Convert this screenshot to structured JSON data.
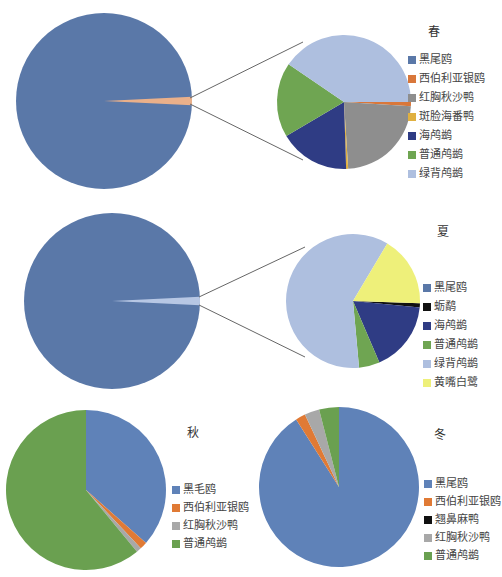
{
  "chart_data": [
    {
      "type": "pie-of-pie",
      "title": "春",
      "primary": {
        "categories": [
          "黑尾鸥",
          "其他"
        ],
        "values": [
          98.5,
          1.5
        ]
      },
      "secondary": {
        "categories": [
          "黑尾鸥",
          "西伯利亚银鸥",
          "红胸秋沙鸭",
          "斑脸海番鸭",
          "海鸬鹚",
          "普通鸬鹚",
          "绿背鸬鹚"
        ],
        "values": [
          0,
          1,
          23,
          0.5,
          17,
          18,
          40.5
        ]
      },
      "legend": [
        "黑尾鸥",
        "西伯利亚银鸥",
        "红胸秋沙鸭",
        "斑脸海番鸭",
        "海鸬鹚",
        "普通鸬鹚",
        "绿背鸬鹚"
      ],
      "colors": [
        "#5a78a8",
        "#d9773a",
        "#8e8e8e",
        "#e0b040",
        "#2f3c84",
        "#6fa552",
        "#aebfdf"
      ]
    },
    {
      "type": "pie-of-pie",
      "title": "夏",
      "primary": {
        "categories": [
          "黑尾鸥",
          "其他"
        ],
        "values": [
          98.5,
          1.5
        ]
      },
      "secondary": {
        "categories": [
          "黑尾鸥",
          "蛎鹬",
          "海鸬鹚",
          "普通鸬鹚",
          "绿背鸬鹚",
          "黄嘴白鹭"
        ],
        "values": [
          0,
          1,
          17,
          5,
          60,
          17
        ]
      },
      "legend": [
        "黑尾鸥",
        "蛎鹬",
        "海鸬鹚",
        "普通鸬鹚",
        "绿背鸬鹚",
        "黄嘴白鹭"
      ],
      "colors": [
        "#5a78a8",
        "#111111",
        "#2f3c84",
        "#6fa552",
        "#aebfdf",
        "#eef07a"
      ]
    },
    {
      "type": "pie",
      "title": "秋",
      "categories": [
        "黑毛鸥",
        "西伯利亚银鸥",
        "红胸秋沙鸭",
        "普通鸬鹚"
      ],
      "values": [
        36.5,
        1.5,
        1,
        61
      ],
      "colors": [
        "#5f82b8",
        "#e07a35",
        "#a8a8a8",
        "#6aa050"
      ]
    },
    {
      "type": "pie",
      "title": "冬",
      "categories": [
        "黑尾鸥",
        "西伯利亚银鸥",
        "翘鼻麻鸭",
        "红胸秋沙鸭",
        "普通鸬鹚"
      ],
      "values": [
        91,
        2,
        0,
        3,
        4
      ],
      "colors": [
        "#5f82b8",
        "#e07a35",
        "#111111",
        "#a8a8a8",
        "#6aa050"
      ]
    }
  ]
}
